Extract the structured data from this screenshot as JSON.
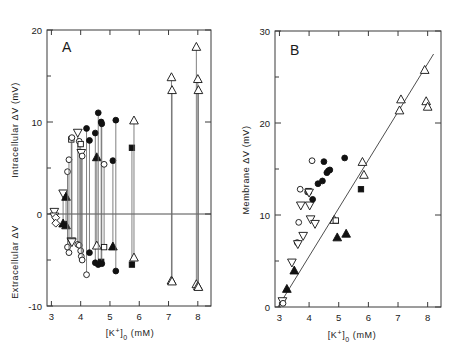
{
  "figure": {
    "panels": [
      {
        "letter": "A",
        "xlabel": "[K⁺]₀  (mM)",
        "ylabel_upper": "Intracellular ΔV  (mV)",
        "ylabel_lower": "Extracellular ΔV",
        "xticks": [
          3,
          4,
          5,
          6,
          7,
          8
        ],
        "yticks": [
          -10,
          0,
          10,
          20
        ],
        "yticklabels": [
          "-10",
          "0",
          "10",
          "20"
        ]
      },
      {
        "letter": "B",
        "xlabel": "[K⁺]₀  (mM)",
        "ylabel": "Membrane ΔV  (mV)",
        "xticks": [
          3,
          4,
          5,
          6,
          7,
          8
        ],
        "yticks": [
          0,
          10,
          20,
          30
        ],
        "yticklabels": [
          "0",
          "10",
          "20",
          "30"
        ]
      }
    ]
  },
  "chart_data": [
    {
      "type": "scatter",
      "panel": "A",
      "title": "A",
      "xlabel": "[K+]o (mM)",
      "ylabel": "Intracellular ΔV / Extracellular ΔV (mV)",
      "xlim": [
        2.85,
        8.45
      ],
      "ylim": [
        -10,
        20
      ],
      "xticks": [
        3,
        4,
        5,
        6,
        7,
        8
      ],
      "yticks": [
        -10,
        0,
        10,
        20
      ],
      "grid": false,
      "legend": false,
      "zero_line": 0,
      "note": "Each vertical line joins the intracellular (upper) and extracellular (lower) ΔV measured at one external K+ concentration.",
      "marker_types": [
        "open-circle",
        "filled-circle",
        "open-up-triangle",
        "filled-up-triangle",
        "open-down-triangle",
        "filled-down-triangle",
        "open-square",
        "filled-square"
      ],
      "pairs": [
        {
          "x": 3.1,
          "intra": 0.2,
          "extra": -0.3,
          "marker_intra": "open-down-triangle",
          "marker_extra": "open-down-triangle"
        },
        {
          "x": 3.15,
          "intra": -0.4,
          "extra": -1.0,
          "marker_intra": "open-diamond",
          "marker_extra": "open-diamond"
        },
        {
          "x": 3.4,
          "intra": 2.2,
          "extra": -1.0,
          "marker_intra": "open-down-triangle",
          "marker_extra": "filled-up-triangle"
        },
        {
          "x": 3.5,
          "intra": 1.9,
          "extra": -1.2,
          "marker_intra": "filled-up-triangle",
          "marker_extra": "filled-up-triangle"
        },
        {
          "x": 3.55,
          "intra": 4.6,
          "extra": -3.6,
          "marker_intra": "open-circle",
          "marker_extra": "open-circle"
        },
        {
          "x": 3.6,
          "intra": 5.9,
          "extra": -4.2,
          "marker_intra": "open-circle",
          "marker_extra": "open-circle"
        },
        {
          "x": 3.68,
          "intra": 8.1,
          "extra": -3.0,
          "marker_intra": "open-square",
          "marker_extra": "open-down-triangle"
        },
        {
          "x": 3.7,
          "intra": 8.3,
          "extra": -3.1,
          "marker_intra": "open-circle",
          "marker_extra": "open-down-triangle"
        },
        {
          "x": 3.9,
          "intra": 8.8,
          "extra": -3.3,
          "marker_intra": "open-down-triangle",
          "marker_extra": "open-circle"
        },
        {
          "x": 3.95,
          "intra": 7.9,
          "extra": -3.4,
          "marker_intra": "open-circle",
          "marker_extra": "open-circle"
        },
        {
          "x": 4.0,
          "intra": 7.6,
          "extra": -4.0,
          "marker_intra": "open-square",
          "marker_extra": "open-circle"
        },
        {
          "x": 4.02,
          "intra": 6.6,
          "extra": -4.6,
          "marker_intra": "open-down-triangle",
          "marker_extra": "open-circle"
        },
        {
          "x": 4.05,
          "intra": 6.3,
          "extra": -5.0,
          "marker_intra": "open-circle",
          "marker_extra": "open-circle"
        },
        {
          "x": 4.2,
          "intra": 9.3,
          "extra": -6.6,
          "marker_intra": "filled-circle",
          "marker_extra": "open-circle"
        },
        {
          "x": 4.3,
          "intra": 8.0,
          "extra": -4.2,
          "marker_intra": "filled-circle",
          "marker_extra": "filled-circle"
        },
        {
          "x": 4.5,
          "intra": 8.8,
          "extra": -5.3,
          "marker_intra": "filled-circle",
          "marker_extra": "filled-circle"
        },
        {
          "x": 4.55,
          "intra": 6.2,
          "extra": -3.4,
          "marker_intra": "filled-up-triangle",
          "marker_extra": "open-up-triangle"
        },
        {
          "x": 4.6,
          "intra": 11.0,
          "extra": -5.5,
          "marker_intra": "filled-circle",
          "marker_extra": "filled-circle"
        },
        {
          "x": 4.7,
          "intra": 10.0,
          "extra": -5.2,
          "marker_intra": "filled-circle",
          "marker_extra": "filled-square"
        },
        {
          "x": 4.72,
          "intra": 9.8,
          "extra": -5.4,
          "marker_intra": "filled-circle",
          "marker_extra": "filled-circle"
        },
        {
          "x": 4.8,
          "intra": 5.4,
          "extra": -3.6,
          "marker_intra": "open-circle",
          "marker_extra": "open-square"
        },
        {
          "x": 5.1,
          "intra": 5.8,
          "extra": -3.5,
          "marker_intra": "filled-circle",
          "marker_extra": "filled-up-triangle"
        },
        {
          "x": 5.2,
          "intra": 10.2,
          "extra": -6.2,
          "marker_intra": "filled-circle",
          "marker_extra": "filled-circle"
        },
        {
          "x": 5.75,
          "intra": 7.2,
          "extra": -5.5,
          "marker_intra": "filled-square",
          "marker_extra": "filled-square"
        },
        {
          "x": 5.82,
          "intra": 10.2,
          "extra": -4.7,
          "marker_intra": "open-up-triangle",
          "marker_extra": "open-up-triangle"
        },
        {
          "x": 7.1,
          "intra": 14.9,
          "extra": -7.2,
          "marker_intra": "open-up-triangle",
          "marker_extra": "open-up-triangle"
        },
        {
          "x": 7.12,
          "intra": 13.5,
          "extra": -7.3,
          "marker_intra": "open-up-triangle",
          "marker_extra": "open-up-triangle"
        },
        {
          "x": 7.95,
          "intra": 18.2,
          "extra": -7.6,
          "marker_intra": "open-up-triangle",
          "marker_extra": "open-up-triangle"
        },
        {
          "x": 8.0,
          "intra": 14.7,
          "extra": -7.8,
          "marker_intra": "open-up-triangle",
          "marker_extra": "open-up-triangle"
        },
        {
          "x": 8.02,
          "intra": 13.5,
          "extra": -7.9,
          "marker_intra": "open-up-triangle",
          "marker_extra": "open-up-triangle"
        }
      ]
    },
    {
      "type": "scatter",
      "panel": "B",
      "title": "B",
      "xlabel": "[K+]o (mM)",
      "ylabel": "Membrane ΔV (mV)",
      "xlim": [
        2.85,
        8.45
      ],
      "ylim": [
        0,
        30
      ],
      "xticks": [
        3,
        4,
        5,
        6,
        7,
        8
      ],
      "yticks": [
        0,
        10,
        20,
        30
      ],
      "grid": false,
      "legend": false,
      "fit_line": {
        "x0": 2.95,
        "y0": 0.0,
        "x1": 8.2,
        "y1": 27.5,
        "description": "theoretical Nernst relation line"
      },
      "points": [
        {
          "x": 3.1,
          "y": 0.6,
          "marker": "open-down-triangle"
        },
        {
          "x": 3.12,
          "y": 0.4,
          "marker": "open-circle"
        },
        {
          "x": 3.25,
          "y": 2.0,
          "marker": "filled-up-triangle"
        },
        {
          "x": 3.42,
          "y": 4.8,
          "marker": "open-down-triangle"
        },
        {
          "x": 3.5,
          "y": 4.0,
          "marker": "filled-up-triangle"
        },
        {
          "x": 3.6,
          "y": 7.0,
          "marker": "open-circle"
        },
        {
          "x": 3.62,
          "y": 6.8,
          "marker": "open-down-triangle"
        },
        {
          "x": 3.65,
          "y": 9.2,
          "marker": "open-circle"
        },
        {
          "x": 3.7,
          "y": 12.8,
          "marker": "open-circle"
        },
        {
          "x": 3.72,
          "y": 11.0,
          "marker": "open-down-triangle"
        },
        {
          "x": 3.8,
          "y": 7.7,
          "marker": "open-down-triangle"
        },
        {
          "x": 3.95,
          "y": 12.5,
          "marker": "open-circle"
        },
        {
          "x": 3.98,
          "y": 12.6,
          "marker": "open-square"
        },
        {
          "x": 4.0,
          "y": 12.4,
          "marker": "open-down-triangle"
        },
        {
          "x": 4.02,
          "y": 11.0,
          "marker": "open-down-triangle"
        },
        {
          "x": 4.05,
          "y": 9.5,
          "marker": "open-down-triangle"
        },
        {
          "x": 4.1,
          "y": 15.9,
          "marker": "open-circle"
        },
        {
          "x": 4.12,
          "y": 11.7,
          "marker": "filled-circle"
        },
        {
          "x": 4.2,
          "y": 9.0,
          "marker": "open-down-triangle"
        },
        {
          "x": 4.3,
          "y": 13.4,
          "marker": "filled-circle"
        },
        {
          "x": 4.45,
          "y": 13.7,
          "marker": "filled-circle"
        },
        {
          "x": 4.5,
          "y": 15.8,
          "marker": "filled-circle"
        },
        {
          "x": 4.6,
          "y": 14.6,
          "marker": "filled-circle"
        },
        {
          "x": 4.65,
          "y": 14.8,
          "marker": "filled-circle"
        },
        {
          "x": 4.7,
          "y": 14.9,
          "marker": "filled-circle"
        },
        {
          "x": 4.85,
          "y": 9.5,
          "marker": "open-up-triangle"
        },
        {
          "x": 4.9,
          "y": 9.4,
          "marker": "open-square"
        },
        {
          "x": 4.95,
          "y": 7.6,
          "marker": "filled-up-triangle"
        },
        {
          "x": 5.2,
          "y": 16.2,
          "marker": "filled-circle"
        },
        {
          "x": 5.25,
          "y": 8.0,
          "marker": "filled-up-triangle"
        },
        {
          "x": 5.75,
          "y": 12.8,
          "marker": "filled-square"
        },
        {
          "x": 5.8,
          "y": 15.8,
          "marker": "open-up-triangle"
        },
        {
          "x": 5.85,
          "y": 14.4,
          "marker": "open-up-triangle"
        },
        {
          "x": 7.05,
          "y": 21.4,
          "marker": "open-up-triangle"
        },
        {
          "x": 7.1,
          "y": 22.6,
          "marker": "open-up-triangle"
        },
        {
          "x": 7.9,
          "y": 25.8,
          "marker": "open-up-triangle"
        },
        {
          "x": 7.95,
          "y": 22.4,
          "marker": "open-up-triangle"
        },
        {
          "x": 8.0,
          "y": 21.8,
          "marker": "open-up-triangle"
        }
      ]
    }
  ]
}
